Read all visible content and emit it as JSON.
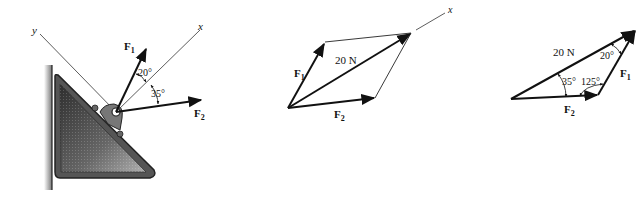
{
  "figures": [
    {
      "id": "free-body",
      "axis_x_label": "x",
      "axis_y_label": "y",
      "force1_label": "F",
      "force1_sub": "1",
      "force2_label": "F",
      "force2_sub": "2",
      "angle_f1_x": "20°",
      "angle_x_f2": "35°"
    },
    {
      "id": "parallelogram",
      "axis_x_label": "x",
      "force1_label": "F",
      "force1_sub": "1",
      "force2_label": "F",
      "force2_sub": "2",
      "resultant_label": "20 N"
    },
    {
      "id": "triangle",
      "force1_label": "F",
      "force1_sub": "1",
      "force2_label": "F",
      "force2_sub": "2",
      "resultant_label": "20 N",
      "angle_top": "20°",
      "angle_left": "35°",
      "angle_right": "125°"
    }
  ],
  "colors": {
    "ink": "#111111",
    "plate_dark": "#3a3a3a",
    "plate_light": "#9a9a9a",
    "wall": "#6a6a6a"
  }
}
